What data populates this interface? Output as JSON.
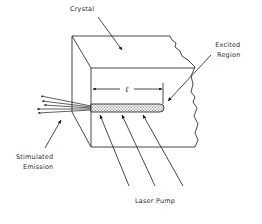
{
  "diagram": {
    "labels": {
      "crystal": "Crystal",
      "excited_region_line1": "Excited",
      "excited_region_line2": "Region",
      "length_symbol": "ℓ",
      "stimulated_emission_line1": "Stimulated",
      "stimulated_emission_line2": "Emission",
      "laser_pump": "Laser Pump"
    },
    "components": [
      {
        "id": "crystal",
        "shape": "cut-away rectangular block (3D) with broken right edge"
      },
      {
        "id": "excited-region",
        "shape": "stippled rod along the front-face bottom edge, length ℓ"
      },
      {
        "id": "length-dimension",
        "shape": "double-headed dimension arrow above rod labeled ℓ"
      },
      {
        "id": "laser-pump-beams",
        "count": 3,
        "shape": "parallel arrows from below-right into rod"
      },
      {
        "id": "stimulated-emission-rays",
        "count": 5,
        "shape": "fanned arrows exiting rod end to the left"
      }
    ],
    "colors": {
      "line": "#1a1a1a",
      "text": "#2a2a2a",
      "rod_fill": "#d8d8d8",
      "background": "#ffffff"
    }
  }
}
